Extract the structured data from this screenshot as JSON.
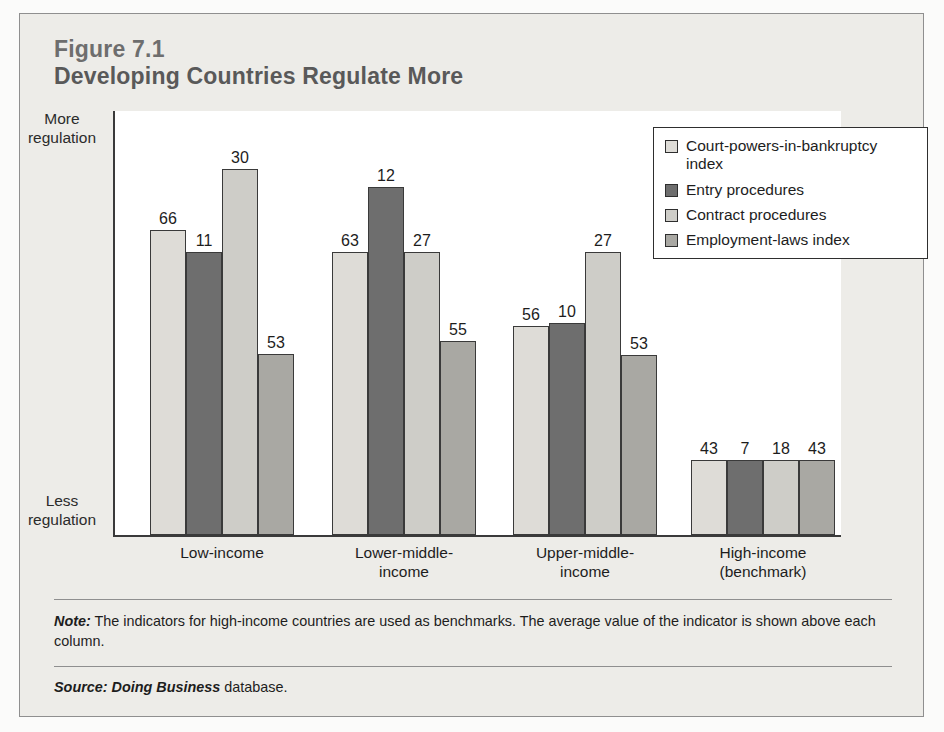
{
  "figure": {
    "number": "Figure 7.1",
    "title": "Developing Countries Regulate More"
  },
  "axis": {
    "top_label": "More regulation",
    "bottom_label": "Less regulation"
  },
  "legend": {
    "items": [
      {
        "label": "Court-powers-in-bankruptcy index",
        "color": "#dedcd7"
      },
      {
        "label": "Entry procedures",
        "color": "#6e6e6e"
      },
      {
        "label": "Contract procedures",
        "color": "#cecdc8"
      },
      {
        "label": "Employment-laws index",
        "color": "#a9a8a3"
      }
    ]
  },
  "footer": {
    "note_label": "Note:",
    "note_text": " The indicators for high-income countries are used as benchmarks. The average value of the indicator is shown above each column.",
    "source_label": "Source:",
    "source_db": " Doing Business",
    "source_text": " database."
  },
  "chart_data": {
    "type": "bar",
    "title": "Developing Countries Regulate More",
    "xlabel": "",
    "ylabel": "",
    "grid": false,
    "legend_position": "top-right",
    "axis_annotations": {
      "top": "More regulation",
      "bottom": "Less regulation"
    },
    "categories": [
      "Low-income",
      "Lower-middle-income",
      "Upper-middle-income",
      "High-income (benchmark)"
    ],
    "series": [
      {
        "name": "Court-powers-in-bankruptcy index",
        "color": "#dedcd7",
        "values": [
          66,
          63,
          56,
          43
        ],
        "pixel_heights": [
          305,
          283,
          209,
          75
        ]
      },
      {
        "name": "Entry procedures",
        "color": "#6e6e6e",
        "values": [
          11,
          12,
          10,
          7
        ],
        "pixel_heights": [
          283,
          348,
          212,
          75
        ]
      },
      {
        "name": "Contract procedures",
        "color": "#cecdc8",
        "values": [
          30,
          27,
          27,
          18
        ],
        "pixel_heights": [
          366,
          283,
          283,
          75
        ]
      },
      {
        "name": "Employment-laws index",
        "color": "#a9a8a3",
        "values": [
          53,
          55,
          53,
          43
        ],
        "pixel_heights": [
          181,
          194,
          180,
          75
        ]
      }
    ],
    "note": "The indicators for high-income countries are used as benchmarks. The average value of the indicator is shown above each column.",
    "source": "Doing Business database."
  }
}
